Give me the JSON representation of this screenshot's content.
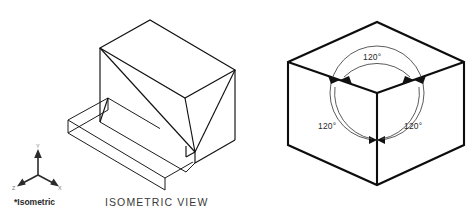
{
  "figure": {
    "title_caption": "ISOMETRIC VIEW",
    "axis_caption": "*Isometric",
    "stroke_color": "#111111",
    "background_color": "#ffffff",
    "circle_color": "#4a4a4a"
  },
  "axis_gizmo": {
    "name": "isometric-axis-triad",
    "labels": {
      "y": "Y",
      "x": "X",
      "z": "Z"
    }
  },
  "left_object": {
    "name": "isometric-solid-part",
    "description": "Isometric view of a wedge block on a rectangular base slab"
  },
  "cube_diagram": {
    "name": "isometric-axis-cube",
    "description": "Cube shown in isometric projection with three 120 degree angles between axes",
    "angles": [
      {
        "id": "top",
        "value": "120°"
      },
      {
        "id": "left",
        "value": "120°"
      },
      {
        "id": "right",
        "value": "120°"
      }
    ]
  }
}
